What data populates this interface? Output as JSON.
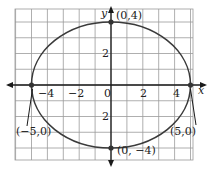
{
  "chart_data": {
    "type": "line",
    "title": "",
    "xlabel": "x",
    "ylabel": "y",
    "equation": "x^2/25 + y^2/16 = 1",
    "xlim": [
      -6,
      5
    ],
    "ylim": [
      -5,
      5
    ],
    "grid": true,
    "x_ticks": [
      {
        "value": -4,
        "label": "−4"
      },
      {
        "value": -2,
        "label": "−2"
      },
      {
        "value": 0,
        "label": "0"
      },
      {
        "value": 2,
        "label": "2"
      },
      {
        "value": 4,
        "label": "4"
      }
    ],
    "y_ticks": [
      {
        "value": 2,
        "label": "2"
      },
      {
        "value": -2,
        "label": "2"
      }
    ],
    "series": [
      {
        "name": "ellipse",
        "a": 5,
        "b": 4,
        "center": [
          0,
          0
        ]
      }
    ],
    "points": [
      {
        "x": 0,
        "y": 4,
        "label": "(0,4)"
      },
      {
        "x": 0,
        "y": -4,
        "label": "(0, −4)"
      },
      {
        "x": -5,
        "y": 0,
        "label": "(−5,0)"
      },
      {
        "x": 5,
        "y": 0,
        "label": "(5,0)"
      }
    ],
    "colors": {
      "curve": "#3a3a3a",
      "grid": "#9a9a9a",
      "axis": "#1a1a1a",
      "point": "#333333"
    }
  }
}
